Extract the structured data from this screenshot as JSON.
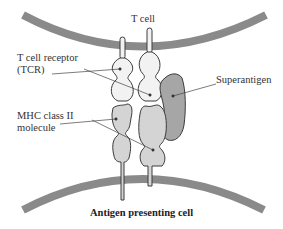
{
  "diagram": {
    "labels": {
      "t_cell": "T cell",
      "tcr_line1": "T cell receptor",
      "tcr_line2": "(TCR)",
      "superantigen": "Superantigen",
      "mhc_line1": "MHC class II",
      "mhc_line2": "molecule",
      "apc": "Antigen presenting cell"
    },
    "colors": {
      "membrane": "#8a8a8a",
      "tcr_fill": "#f2f2f2",
      "mhc_fill": "#d4d4d4",
      "superantigen_fill": "#a6a6a6",
      "outline": "#3c3c3c"
    }
  }
}
